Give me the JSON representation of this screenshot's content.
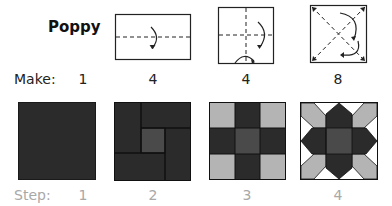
{
  "title": "Poppy",
  "make": {
    "label": "Make:",
    "counts": [
      "1",
      "4",
      "4",
      "8"
    ]
  },
  "step": {
    "label": "Step:",
    "numbers": [
      "1",
      "2",
      "3",
      "4"
    ]
  },
  "fold_diagrams": [
    {
      "shape": "rectangle",
      "folds": "horizontal center fold",
      "icon": "fold-arrow-icon"
    },
    {
      "shape": "square",
      "folds": "horizontal and vertical center folds",
      "icon": "fold-arrow-icon"
    },
    {
      "shape": "square",
      "folds": "diagonal folds",
      "icon": "fold-arrow-icon"
    }
  ],
  "colors": {
    "dark": "#2b2b2b",
    "center": "#4a4a4a",
    "light": "#b4b4b4",
    "white": "#ffffff",
    "outline": "#1a1a1a",
    "step_text": "#a8a8a8"
  }
}
